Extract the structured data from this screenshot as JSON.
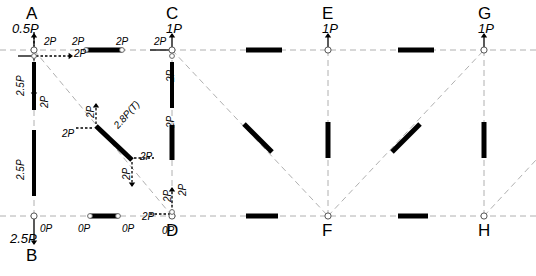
{
  "diagram": {
    "type": "structural-truss-force-analysis",
    "colors": {
      "member": "#000000",
      "grid": "#b0b0b0",
      "text": "#000000",
      "background": "#ffffff"
    },
    "nodes": [
      {
        "id": "A",
        "label": "A",
        "x": 34,
        "y": 50,
        "letter_x": 26,
        "letter_y": 5,
        "load": "0.5P",
        "load_x": 12,
        "load_y": 22
      },
      {
        "id": "B",
        "label": "B",
        "x": 34,
        "y": 216,
        "letter_x": 26,
        "letter_y": 247,
        "load": "2.5P",
        "load_x": 10,
        "load_y": 232
      },
      {
        "id": "C",
        "label": "C",
        "x": 172,
        "y": 50,
        "letter_x": 166,
        "letter_y": 5,
        "load": "1P",
        "load_x": 166,
        "load_y": 22
      },
      {
        "id": "D",
        "label": "D",
        "x": 172,
        "y": 216,
        "letter_x": 166,
        "letter_y": 222,
        "load": "",
        "load_x": 0,
        "load_y": 0
      },
      {
        "id": "E",
        "label": "E",
        "x": 328,
        "y": 50,
        "letter_x": 322,
        "letter_y": 5,
        "load": "1P",
        "load_x": 322,
        "load_y": 22
      },
      {
        "id": "F",
        "label": "F",
        "x": 328,
        "y": 216,
        "letter_x": 322,
        "letter_y": 222,
        "load": "",
        "load_x": 0,
        "load_y": 0
      },
      {
        "id": "G",
        "label": "G",
        "x": 484,
        "y": 50,
        "letter_x": 478,
        "letter_y": 5,
        "load": "1P",
        "load_x": 478,
        "load_y": 22
      },
      {
        "id": "H",
        "label": "H",
        "x": 484,
        "y": 216,
        "letter_x": 478,
        "letter_y": 222,
        "load": "",
        "load_x": 0,
        "load_y": 0
      }
    ],
    "gridlines": [
      {
        "name": "top-chord",
        "x1": 0,
        "y1": 50,
        "x2": 536,
        "y2": 50
      },
      {
        "name": "bottom-chord",
        "x1": 0,
        "y1": 216,
        "x2": 536,
        "y2": 216
      },
      {
        "name": "column-A-B",
        "x1": 34,
        "y1": 50,
        "x2": 34,
        "y2": 216
      },
      {
        "name": "column-C-D",
        "x1": 172,
        "y1": 50,
        "x2": 172,
        "y2": 216
      },
      {
        "name": "column-E-F",
        "x1": 328,
        "y1": 50,
        "x2": 328,
        "y2": 216
      },
      {
        "name": "column-G-H",
        "x1": 484,
        "y1": 50,
        "x2": 484,
        "y2": 216
      },
      {
        "name": "diagonal-A-D",
        "x1": 34,
        "y1": 50,
        "x2": 172,
        "y2": 216
      },
      {
        "name": "diagonal-C-F",
        "x1": 172,
        "y1": 50,
        "x2": 328,
        "y2": 216
      },
      {
        "name": "diagonal-F-G",
        "x1": 328,
        "y1": 216,
        "x2": 484,
        "y2": 50
      },
      {
        "name": "diagonal-H-right",
        "x1": 484,
        "y1": 216,
        "x2": 536,
        "y2": 160
      }
    ],
    "members": [
      {
        "name": "member-AC-top",
        "x1": 86,
        "y1": 50,
        "x2": 122,
        "y2": 50,
        "width": 5
      },
      {
        "name": "member-CE-top",
        "x1": 246,
        "y1": 50,
        "x2": 282,
        "y2": 50,
        "width": 5
      },
      {
        "name": "member-EG-top",
        "x1": 398,
        "y1": 50,
        "x2": 434,
        "y2": 50,
        "width": 5
      },
      {
        "name": "member-AB-col",
        "x1": 34,
        "y1": 62,
        "x2": 34,
        "y2": 110,
        "width": 4
      },
      {
        "name": "member-AB-col-lower",
        "x1": 34,
        "y1": 130,
        "x2": 34,
        "y2": 196,
        "width": 4
      },
      {
        "name": "member-CD-col",
        "x1": 172,
        "y1": 62,
        "x2": 172,
        "y2": 108,
        "width": 4
      },
      {
        "name": "member-CD-col-lower",
        "x1": 172,
        "y1": 125,
        "x2": 172,
        "y2": 160,
        "width": 5
      },
      {
        "name": "member-EF-col",
        "x1": 328,
        "y1": 122,
        "x2": 328,
        "y2": 158,
        "width": 5
      },
      {
        "name": "member-GH-col",
        "x1": 484,
        "y1": 122,
        "x2": 484,
        "y2": 158,
        "width": 5
      },
      {
        "name": "member-BD-bottom",
        "x1": 90,
        "y1": 216,
        "x2": 118,
        "y2": 216,
        "width": 5
      },
      {
        "name": "member-DF-bottom",
        "x1": 246,
        "y1": 216,
        "x2": 278,
        "y2": 216,
        "width": 5
      },
      {
        "name": "member-FH-bottom",
        "x1": 398,
        "y1": 216,
        "x2": 428,
        "y2": 216,
        "width": 5
      },
      {
        "name": "member-diag-AD",
        "x1": 96,
        "y1": 126,
        "x2": 132,
        "y2": 160,
        "width": 5
      },
      {
        "name": "member-diag-CF",
        "x1": 244,
        "y1": 124,
        "x2": 272,
        "y2": 152,
        "width": 5
      },
      {
        "name": "member-diag-FG",
        "x1": 392,
        "y1": 152,
        "x2": 420,
        "y2": 124,
        "width": 5
      }
    ],
    "force_labels": [
      {
        "name": "force-A-top-right",
        "text": "2P",
        "x": 44,
        "y": 37,
        "rot": 0,
        "size": "sm"
      },
      {
        "name": "force-A-horiz",
        "text": "2P",
        "x": 74,
        "y": 49,
        "rot": 0,
        "size": "sm"
      },
      {
        "name": "force-A-left-2p5",
        "text": "2.5P",
        "x": 16,
        "y": 96,
        "rot": -90,
        "size": "sm"
      },
      {
        "name": "force-A-down-2p",
        "text": "2P",
        "x": 40,
        "y": 108,
        "rot": -90,
        "size": "sm"
      },
      {
        "name": "force-B-up-2p5",
        "text": "2.5P",
        "x": 16,
        "y": 180,
        "rot": -90,
        "size": "sm"
      },
      {
        "name": "force-B-zero",
        "text": "0P",
        "x": 40,
        "y": 224,
        "rot": 0,
        "size": "sm"
      },
      {
        "name": "force-top-AC-left",
        "text": "2P",
        "x": 72,
        "y": 37,
        "rot": 0,
        "size": "sm"
      },
      {
        "name": "force-top-AC-right",
        "text": "2P",
        "x": 116,
        "y": 37,
        "rot": 0,
        "size": "sm"
      },
      {
        "name": "force-diag-label",
        "text": "2.8P(T)",
        "x": 112,
        "y": 124,
        "rot": -48,
        "size": "sm"
      },
      {
        "name": "force-diag-upper-2p",
        "text": "2P",
        "x": 86,
        "y": 118,
        "rot": -90,
        "size": "sm"
      },
      {
        "name": "force-diag-left-2p",
        "text": "2P",
        "x": 62,
        "y": 129,
        "rot": 0,
        "size": "sm"
      },
      {
        "name": "force-diag-right-2p",
        "text": "2P",
        "x": 140,
        "y": 152,
        "rot": 0,
        "size": "sm"
      },
      {
        "name": "force-diag-lower-2p",
        "text": "2P",
        "x": 122,
        "y": 180,
        "rot": -90,
        "size": "sm"
      },
      {
        "name": "force-bottom-BD-left",
        "text": "0P",
        "x": 78,
        "y": 224,
        "rot": 0,
        "size": "sm"
      },
      {
        "name": "force-bottom-BD-right",
        "text": "0P",
        "x": 122,
        "y": 224,
        "rot": 0,
        "size": "sm"
      },
      {
        "name": "force-C-left-2p",
        "text": "2P",
        "x": 154,
        "y": 37,
        "rot": 0,
        "size": "sm"
      },
      {
        "name": "force-C-down-2p",
        "text": "2P",
        "x": 166,
        "y": 82,
        "rot": -90,
        "size": "sm"
      },
      {
        "name": "force-CD-mid-2p",
        "text": "2P",
        "x": 166,
        "y": 128,
        "rot": -90,
        "size": "sm"
      },
      {
        "name": "force-D-up-2p",
        "text": "2P",
        "x": 163,
        "y": 202,
        "rot": -90,
        "size": "sm"
      },
      {
        "name": "force-D-right-2p",
        "text": "2P",
        "x": 178,
        "y": 196,
        "rot": -90,
        "size": "sm"
      },
      {
        "name": "force-D-left-2p",
        "text": "2P",
        "x": 142,
        "y": 212,
        "rot": 0,
        "size": "sm"
      },
      {
        "name": "force-D-zero",
        "text": "0P",
        "x": 162,
        "y": 226,
        "rot": 0,
        "size": "sm"
      }
    ]
  }
}
